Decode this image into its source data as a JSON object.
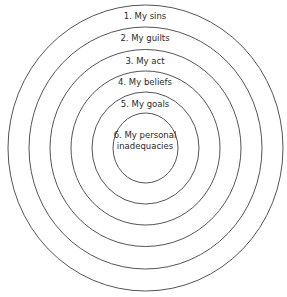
{
  "diagram": {
    "type": "concentric-circles",
    "stroke_color": "#555555",
    "layers": [
      {
        "label": "1. My sins",
        "label_line2": ""
      },
      {
        "label": "2. My guilts",
        "label_line2": ""
      },
      {
        "label": "3. My act",
        "label_line2": ""
      },
      {
        "label": "4. My beliefs",
        "label_line2": ""
      },
      {
        "label": "5. My goals",
        "label_line2": ""
      },
      {
        "label": "6. My personal",
        "label_line2": "inadequacies"
      }
    ]
  }
}
